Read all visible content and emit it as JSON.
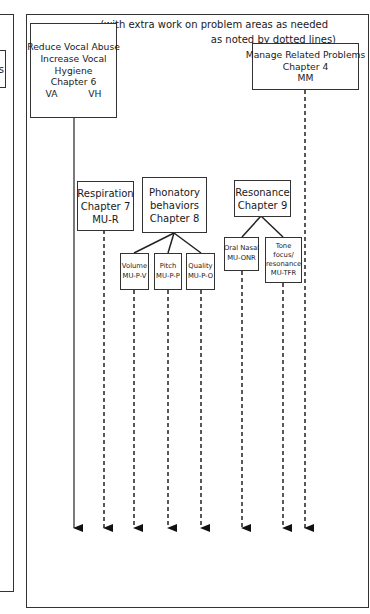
{
  "caption": {
    "line1": "(with extra work on problem areas as needed",
    "line2": "as noted by dotted lines)"
  },
  "left_partial_box": {
    "text": "s"
  },
  "nodes": {
    "reduce": {
      "lines": [
        "Reduce Vocal Abuse",
        "Increase Vocal",
        "Hygiene",
        "Chapter 6"
      ],
      "codes": [
        "VA",
        "VH"
      ]
    },
    "manage": {
      "lines": [
        "Manage Related Problems",
        "Chapter 4",
        "MM"
      ]
    },
    "respiration": {
      "lines": [
        "Respiration",
        "Chapter 7",
        "MU-R"
      ]
    },
    "phonatory": {
      "lines": [
        "Phonatory",
        "behaviors",
        "Chapter 8"
      ]
    },
    "volume": {
      "lines": [
        "Volume",
        "MU-P-V"
      ]
    },
    "pitch": {
      "lines": [
        "Pitch",
        "MU-P-P"
      ]
    },
    "quality": {
      "lines": [
        "Quality",
        "MU-P-O"
      ]
    },
    "resonance": {
      "lines": [
        "Resonance",
        "Chapter 9"
      ]
    },
    "oral_nasal": {
      "lines": [
        "Oral Nasal",
        "MU-ONR"
      ]
    },
    "tone_focus": {
      "lines": [
        "Tone",
        "focus/",
        "resonance",
        "MU-TFR"
      ]
    }
  },
  "arrows": [
    {
      "from": "reduce",
      "x": 74,
      "style": "solid"
    },
    {
      "from": "respiration",
      "x": 104,
      "style": "dashed"
    },
    {
      "from": "volume",
      "x": 134,
      "style": "dashed"
    },
    {
      "from": "pitch",
      "x": 168,
      "style": "dashed"
    },
    {
      "from": "quality",
      "x": 201,
      "style": "dashed"
    },
    {
      "from": "oral_nasal",
      "x": 242,
      "style": "dashed"
    },
    {
      "from": "tone_focus",
      "x": 283,
      "style": "dashed"
    },
    {
      "from": "manage",
      "x": 305,
      "style": "dashed"
    }
  ],
  "colors": {
    "line": "#222222",
    "background": "#ffffff"
  }
}
